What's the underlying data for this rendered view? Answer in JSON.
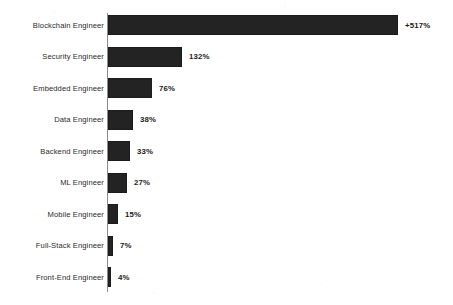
{
  "chart_data": {
    "type": "bar",
    "orientation": "horizontal",
    "title": "",
    "subtitle": "",
    "xlabel": "",
    "ylabel": "",
    "grid": false,
    "legend": false,
    "axis_line": true,
    "xlim": [
      0,
      517
    ],
    "value_suffix": "%",
    "categories": [
      "Blockchain Engineer",
      "Security Engineer",
      "Embedded Engineer",
      "Data Engineer",
      "Backend  Engineer",
      "ML Engineer",
      "Mobile Engineer",
      "Full-Stack Engineer",
      "Front-End Engineer"
    ],
    "values": [
      517,
      132,
      76,
      38,
      33,
      27,
      15,
      7,
      4
    ],
    "value_labels": [
      "+517%",
      "132%",
      "76%",
      "38%",
      "33%",
      "27%",
      "15%",
      "7%",
      "4%"
    ],
    "bars": [
      {
        "label": "Blockchain Engineer",
        "value": 517,
        "value_label": "+517%",
        "bar_px": 290
      },
      {
        "label": "Security Engineer",
        "value": 132,
        "value_label": "132%",
        "bar_px": 74
      },
      {
        "label": "Embedded Engineer",
        "value": 76,
        "value_label": "76%",
        "bar_px": 44
      },
      {
        "label": "Data Engineer",
        "value": 38,
        "value_label": "38%",
        "bar_px": 25
      },
      {
        "label": "Backend  Engineer",
        "value": 33,
        "value_label": "33%",
        "bar_px": 22
      },
      {
        "label": "ML Engineer",
        "value": 27,
        "value_label": "27%",
        "bar_px": 19
      },
      {
        "label": "Mobile Engineer",
        "value": 15,
        "value_label": "15%",
        "bar_px": 10
      },
      {
        "label": "Full-Stack Engineer",
        "value": 7,
        "value_label": "7%",
        "bar_px": 5
      },
      {
        "label": "Front-End Engineer",
        "value": 4,
        "value_label": "4%",
        "bar_px": 3
      }
    ],
    "colors": {
      "bar": "#232323",
      "background": "#ffffff",
      "text": "#2a2a2a",
      "value_text": "#1c1c1c",
      "axis": "#8c8c8c"
    }
  }
}
